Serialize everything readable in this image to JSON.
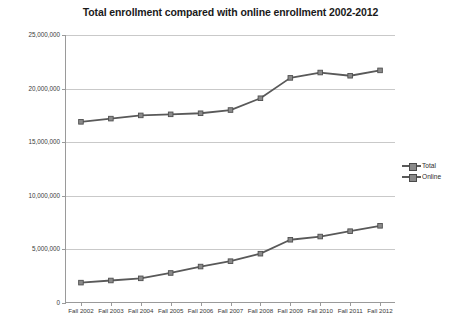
{
  "chart_data": {
    "type": "line",
    "title": "Total enrollment compared with online enrollment 2002-2012",
    "xlabel": "",
    "ylabel": "",
    "categories": [
      "Fall 2002",
      "Fall 2003",
      "Fall 2004",
      "Fall 2005",
      "Fall 2006",
      "Fall 2007",
      "Fall 2008",
      "Fall 2009",
      "Fall 2010",
      "Fall 2011",
      "Fall 2012"
    ],
    "series": [
      {
        "name": "Total",
        "color": "#595959",
        "values": [
          16900000,
          17200000,
          17500000,
          17600000,
          17700000,
          18000000,
          19100000,
          21000000,
          21500000,
          21200000,
          21700000
        ]
      },
      {
        "name": "Online",
        "color": "#595959",
        "values": [
          1900000,
          2100000,
          2300000,
          2800000,
          3400000,
          3900000,
          4600000,
          5900000,
          6200000,
          6700000,
          7200000
        ]
      }
    ],
    "ylim": [
      0,
      25000000
    ],
    "ytick_values": [
      0,
      5000000,
      10000000,
      15000000,
      20000000,
      25000000
    ],
    "ytick_labels": [
      "0",
      "5,000,000",
      "10,000,000",
      "15,000,000",
      "20,000,000",
      "25,000,000"
    ],
    "grid": true,
    "legend_position": "right",
    "legend_entries": [
      "Total",
      "Online"
    ],
    "marker": "square",
    "background_color": "#ffffff",
    "gridline_color": "#c9c9c9",
    "axis_color": "#9a9a9a",
    "title_color": "#1a1a1a"
  }
}
